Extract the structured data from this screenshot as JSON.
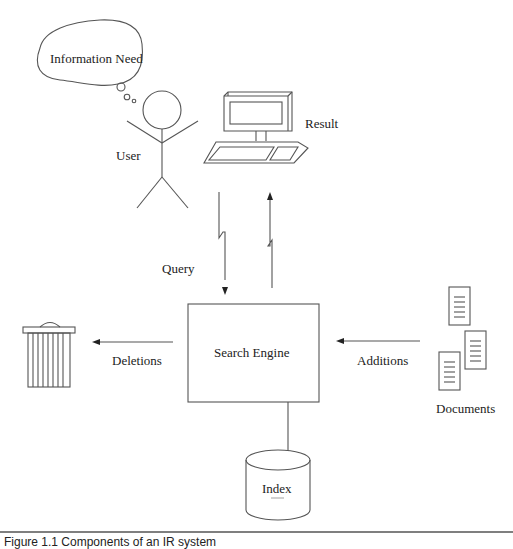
{
  "diagram": {
    "title": "Components of an IR system",
    "nodes": {
      "information_need": "Information Need",
      "user": "User",
      "search_engine": "Search Engine",
      "index": "Index",
      "documents": "Documents"
    },
    "edges": {
      "query": "Query",
      "result": "Result",
      "deletions": "Deletions",
      "additions": "Additions"
    },
    "caption": "Figure 1.1   Components of an IR system"
  },
  "colors": {
    "stroke": "#555555",
    "text": "#222222",
    "background": "#ffffff"
  }
}
